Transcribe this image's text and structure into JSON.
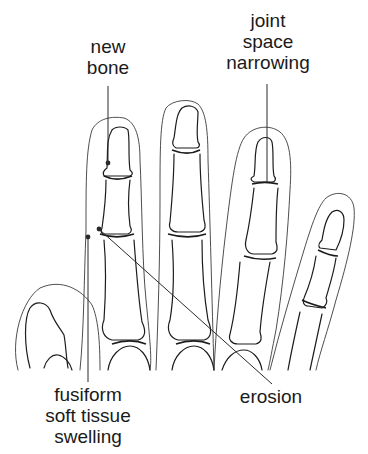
{
  "diagram": {
    "colors": {
      "background": "#ffffff",
      "line": "#1c1c1c"
    },
    "labels": {
      "new_bone": {
        "lines": [
          "new",
          "bone"
        ]
      },
      "joint_space_narrowing": {
        "lines": [
          "joint",
          "space",
          "narrowing"
        ]
      },
      "fusiform_soft_tissue_swelling": {
        "lines": [
          "fusiform",
          "soft tissue",
          "swelling"
        ]
      },
      "erosion": {
        "lines": [
          "erosion"
        ]
      }
    }
  }
}
